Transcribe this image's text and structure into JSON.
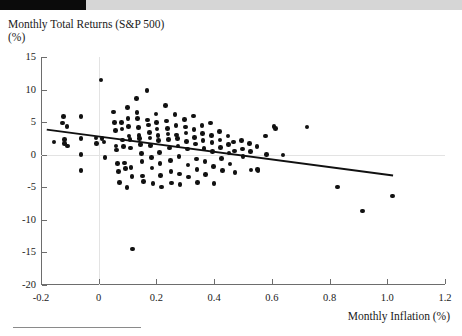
{
  "header": {
    "redacted_label": "",
    "strip_color": "#d6d6d6",
    "block_color": "#0b0b0b"
  },
  "chart_data": {
    "type": "scatter",
    "title": "Monthly Total Returns (S&P 500)",
    "ylabel": "(%)",
    "xlabel": "Monthly Inflation (%)",
    "xlim": [
      -0.2,
      1.2
    ],
    "ylim": [
      -20,
      15
    ],
    "xticks": [
      -0.2,
      0,
      0.2,
      0.4,
      0.6,
      0.8,
      1.0,
      1.2
    ],
    "xticklabels": [
      "-0.2",
      "0",
      "0.2",
      "0.4",
      "0.6",
      "0.8",
      "1.0",
      "1.2"
    ],
    "yticks": [
      15,
      10,
      5,
      0,
      -5,
      -10,
      -15,
      -20
    ],
    "yticklabels": [
      "15",
      "10",
      "5",
      "0",
      "-5",
      "-10",
      "-15",
      "-20"
    ],
    "grid": true,
    "gridlines": {
      "x": [
        0
      ],
      "y": [
        0
      ]
    },
    "legend": null,
    "marker_color": "#111111",
    "trendline": {
      "color": "#111111",
      "x0": -0.18,
      "y0": 3.85,
      "x1": 1.02,
      "y1": -3.2,
      "slope": -5.88,
      "intercept": 2.79
    },
    "points": [
      [
        -0.155,
        1.95
      ],
      [
        -0.125,
        4.85
      ],
      [
        -0.122,
        5.85
      ],
      [
        -0.118,
        1.75
      ],
      [
        -0.118,
        2.3
      ],
      [
        -0.11,
        4.35
      ],
      [
        -0.108,
        1.35
      ],
      [
        -0.062,
        5.85
      ],
      [
        -0.062,
        2.45
      ],
      [
        -0.062,
        0.05
      ],
      [
        -0.062,
        -2.45
      ],
      [
        -0.01,
        2.55
      ],
      [
        -0.008,
        1.7
      ],
      [
        0.008,
        11.45
      ],
      [
        0.012,
        2.45
      ],
      [
        0.018,
        1.95
      ],
      [
        0.022,
        -0.45
      ],
      [
        0.052,
        6.55
      ],
      [
        0.055,
        4.95
      ],
      [
        0.058,
        3.75
      ],
      [
        0.06,
        1.35
      ],
      [
        0.062,
        0.7
      ],
      [
        0.065,
        -1.35
      ],
      [
        0.068,
        -2.55
      ],
      [
        0.072,
        -4.25
      ],
      [
        0.078,
        4.95
      ],
      [
        0.08,
        3.95
      ],
      [
        0.082,
        2.25
      ],
      [
        0.085,
        1.25
      ],
      [
        0.09,
        -1.25
      ],
      [
        0.092,
        -2.15
      ],
      [
        0.098,
        -5.05
      ],
      [
        0.1,
        7.25
      ],
      [
        0.102,
        5.55
      ],
      [
        0.104,
        4.35
      ],
      [
        0.105,
        2.85
      ],
      [
        0.108,
        2.35
      ],
      [
        0.11,
        1.05
      ],
      [
        0.112,
        -1.95
      ],
      [
        0.115,
        -3.35
      ],
      [
        0.118,
        -14.45
      ],
      [
        0.13,
        8.65
      ],
      [
        0.132,
        6.45
      ],
      [
        0.135,
        5.55
      ],
      [
        0.138,
        4.15
      ],
      [
        0.14,
        2.95
      ],
      [
        0.142,
        2.45
      ],
      [
        0.145,
        1.55
      ],
      [
        0.148,
        0.15
      ],
      [
        0.15,
        -1.05
      ],
      [
        0.152,
        -3.25
      ],
      [
        0.155,
        -4.15
      ],
      [
        0.168,
        9.85
      ],
      [
        0.17,
        5.35
      ],
      [
        0.172,
        4.55
      ],
      [
        0.175,
        3.45
      ],
      [
        0.178,
        2.55
      ],
      [
        0.18,
        1.45
      ],
      [
        0.182,
        -0.45
      ],
      [
        0.185,
        -2.05
      ],
      [
        0.188,
        -4.45
      ],
      [
        0.198,
        6.25
      ],
      [
        0.2,
        4.95
      ],
      [
        0.202,
        3.95
      ],
      [
        0.205,
        2.95
      ],
      [
        0.208,
        2.15
      ],
      [
        0.21,
        0.35
      ],
      [
        0.212,
        -1.35
      ],
      [
        0.215,
        -3.15
      ],
      [
        0.218,
        -4.95
      ],
      [
        0.232,
        7.55
      ],
      [
        0.235,
        5.15
      ],
      [
        0.238,
        4.05
      ],
      [
        0.24,
        3.15
      ],
      [
        0.242,
        2.35
      ],
      [
        0.245,
        1.05
      ],
      [
        0.248,
        -0.85
      ],
      [
        0.25,
        -2.55
      ],
      [
        0.252,
        -4.35
      ],
      [
        0.265,
        6.15
      ],
      [
        0.268,
        4.45
      ],
      [
        0.27,
        3.05
      ],
      [
        0.272,
        2.45
      ],
      [
        0.275,
        1.35
      ],
      [
        0.278,
        -0.25
      ],
      [
        0.28,
        -2.95
      ],
      [
        0.282,
        -4.55
      ],
      [
        0.298,
        5.45
      ],
      [
        0.3,
        4.25
      ],
      [
        0.302,
        3.35
      ],
      [
        0.305,
        2.05
      ],
      [
        0.308,
        0.85
      ],
      [
        0.31,
        -1.55
      ],
      [
        0.312,
        -3.45
      ],
      [
        0.328,
        5.95
      ],
      [
        0.33,
        3.85
      ],
      [
        0.332,
        2.65
      ],
      [
        0.335,
        1.65
      ],
      [
        0.338,
        -0.65
      ],
      [
        0.34,
        -2.25
      ],
      [
        0.342,
        -4.25
      ],
      [
        0.358,
        4.45
      ],
      [
        0.36,
        3.25
      ],
      [
        0.362,
        2.15
      ],
      [
        0.365,
        0.95
      ],
      [
        0.368,
        -1.05
      ],
      [
        0.37,
        -3.05
      ],
      [
        0.388,
        4.85
      ],
      [
        0.39,
        2.95
      ],
      [
        0.392,
        1.85
      ],
      [
        0.395,
        0.45
      ],
      [
        0.398,
        -1.85
      ],
      [
        0.4,
        -4.45
      ],
      [
        0.418,
        3.55
      ],
      [
        0.42,
        2.25
      ],
      [
        0.422,
        1.15
      ],
      [
        0.425,
        -0.55
      ],
      [
        0.428,
        -2.45
      ],
      [
        0.448,
        2.85
      ],
      [
        0.45,
        1.55
      ],
      [
        0.452,
        0.25
      ],
      [
        0.455,
        -1.45
      ],
      [
        0.468,
        1.95
      ],
      [
        0.47,
        0.55
      ],
      [
        0.472,
        -2.75
      ],
      [
        0.495,
        2.15
      ],
      [
        0.498,
        0.85
      ],
      [
        0.5,
        -0.25
      ],
      [
        0.522,
        1.75
      ],
      [
        0.525,
        0.45
      ],
      [
        0.528,
        -2.35
      ],
      [
        0.548,
        1.25
      ],
      [
        0.55,
        -2.25
      ],
      [
        0.552,
        -2.45
      ],
      [
        0.578,
        2.85
      ],
      [
        0.582,
        0.05
      ],
      [
        0.608,
        4.35
      ],
      [
        0.612,
        4.05
      ],
      [
        0.638,
        -0.05
      ],
      [
        0.722,
        4.25
      ],
      [
        0.828,
        -4.95
      ],
      [
        0.915,
        -8.65
      ],
      [
        1.018,
        -6.35
      ]
    ]
  }
}
